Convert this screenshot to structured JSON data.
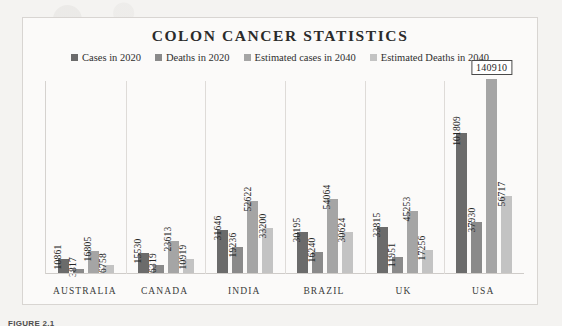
{
  "figure": {
    "caption": "FIGURE 2.1"
  },
  "chart_data": {
    "type": "bar",
    "title": "COLON CANCER STATISTICS",
    "xlabel": "",
    "ylabel": "",
    "grid": false,
    "legend_position": "top",
    "ylim": [
      0,
      140910
    ],
    "categories": [
      "AUSTRALIA",
      "CANADA",
      "INDIA",
      "BRAZIL",
      "UK",
      "USA"
    ],
    "series": [
      {
        "name": "Cases in 2020",
        "color": "#6b6b6b",
        "values": [
          10861,
          15530,
          31646,
          30195,
          33815,
          101809
        ]
      },
      {
        "name": "Deaths in 2020",
        "color": "#8a8a8a",
        "values": [
          3817,
          6319,
          19236,
          16240,
          11951,
          37930
        ]
      },
      {
        "name": "Estimated cases in 2040",
        "color": "#a5a5a5",
        "values": [
          16805,
          23613,
          52622,
          54064,
          45253,
          140910
        ]
      },
      {
        "name": "Estimated Deaths in 2040",
        "color": "#c3c3c3",
        "values": [
          6758,
          10919,
          33200,
          30624,
          17256,
          56717
        ]
      }
    ],
    "highlighted_label": "140910"
  }
}
